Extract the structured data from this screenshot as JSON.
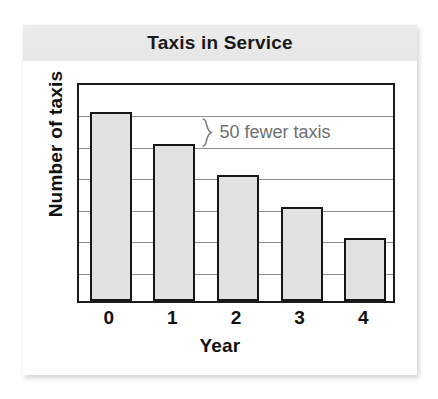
{
  "chart_data": {
    "type": "bar",
    "title": "Taxis in Service",
    "xlabel": "Year",
    "ylabel": "Number of taxis",
    "categories": [
      "0",
      "1",
      "2",
      "3",
      "4"
    ],
    "values": [
      300,
      250,
      200,
      150,
      100
    ],
    "ylim": [
      0,
      350
    ],
    "y_gridline_step": 50,
    "y_gridline_count": 7,
    "y_tick_labels_shown": false,
    "grid": true,
    "legend": false,
    "annotations": [
      {
        "text": "50 fewer taxis",
        "icon": "curly-brace",
        "from_category": "0",
        "to_category": "1",
        "difference": 50,
        "color": "#6f6f6f"
      }
    ],
    "colors": {
      "bar_fill": "#e2e2e2",
      "bar_stroke": "#161616",
      "gridline": "#8d8d8d",
      "axis": "#1b1b1b",
      "title_band": "#ececec",
      "text": "#111111"
    }
  }
}
